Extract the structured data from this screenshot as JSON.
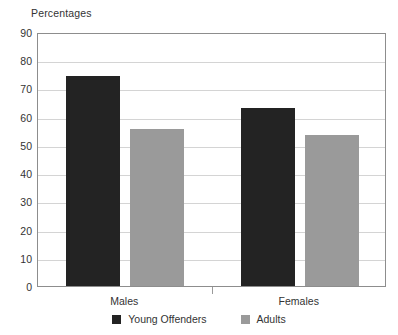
{
  "chart_data": {
    "type": "bar",
    "title": "Percentages",
    "xlabel": "",
    "ylabel": "",
    "ylim": [
      0,
      90
    ],
    "ytick_step": 10,
    "yticks": [
      90,
      80,
      70,
      60,
      50,
      40,
      30,
      20,
      10,
      0
    ],
    "grid": true,
    "legend_position": "bottom",
    "categories": [
      "Males",
      "Females"
    ],
    "series": [
      {
        "name": "Young Offenders",
        "color": "#232323",
        "values": [
          74.5,
          63
        ]
      },
      {
        "name": "Adults",
        "color": "#9a9a9a",
        "values": [
          55.5,
          53.5
        ]
      }
    ]
  },
  "style": {
    "plot_border_color": "#8d8d8d",
    "gridline_color": "#d4d4d4",
    "text_color": "#333333",
    "background": "#ffffff"
  }
}
